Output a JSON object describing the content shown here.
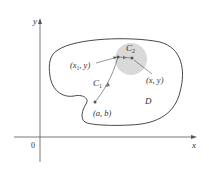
{
  "diagram": {
    "axes": {
      "x_label": "x",
      "y_label": "y",
      "origin_label": "0"
    },
    "region_label": "D",
    "points": [
      {
        "id": "start",
        "label": "(a, b)"
      },
      {
        "id": "x1y",
        "label_main": "(x",
        "label_sub": "1",
        "label_tail": ", y)"
      },
      {
        "id": "xy",
        "label": "(x, y)"
      }
    ],
    "curves": [
      {
        "id": "C1",
        "label_main": "C",
        "label_sub": "1"
      },
      {
        "id": "C2",
        "label_main": "C",
        "label_sub": "2"
      }
    ],
    "colors": {
      "stroke": "#333333",
      "path": "#777777",
      "disk": "#d9d9d9",
      "axis": "#555555"
    }
  }
}
